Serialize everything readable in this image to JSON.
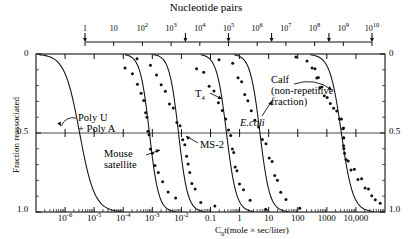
{
  "chart_data": {
    "type": "line",
    "title": "Nucleotide pairs",
    "xlabel": "C0t(mole × sec/liter)",
    "ylabel": "Fraction reassociated",
    "xlim_log10": [
      -7,
      5
    ],
    "ylim": [
      0,
      1
    ],
    "yaxis_inverted": true,
    "grid": false,
    "legend_position": "inline-annotations",
    "y_ticks": [
      {
        "value": 0,
        "label": "0"
      },
      {
        "value": 0.5,
        "label": "0.5"
      },
      {
        "value": 1.0,
        "label": "1.0"
      }
    ],
    "y_ticks_right": [
      {
        "value": 0,
        "label": "0"
      },
      {
        "value": 0.5,
        "label": "0.5"
      },
      {
        "value": 1.0,
        "label": "1.0"
      }
    ],
    "x_ticks": [
      {
        "log10": -6,
        "label": "10⁻⁶",
        "base": "10",
        "exp": "-6"
      },
      {
        "log10": -5,
        "label": "10⁻⁵",
        "base": "10",
        "exp": "-5"
      },
      {
        "log10": -4,
        "label": "10⁻⁴",
        "base": "10",
        "exp": "-4"
      },
      {
        "log10": -3,
        "label": "10⁻³",
        "base": "10",
        "exp": "-3"
      },
      {
        "log10": -2,
        "label": "10⁻²",
        "base": "10",
        "exp": "-2"
      },
      {
        "log10": -1,
        "label": "0.1",
        "base": "0.1",
        "exp": ""
      },
      {
        "log10": 0,
        "label": "1",
        "base": "1",
        "exp": ""
      },
      {
        "log10": 1,
        "label": "10",
        "base": "10",
        "exp": ""
      },
      {
        "log10": 2,
        "label": "100",
        "base": "100",
        "exp": ""
      },
      {
        "log10": 3,
        "label": "1000",
        "base": "1000",
        "exp": ""
      },
      {
        "log10": 4,
        "label": "10,000",
        "base": "10,000",
        "exp": ""
      }
    ],
    "top_axis": {
      "title": "Nucleotide pairs",
      "range_log10": [
        0,
        10
      ],
      "ticks": [
        {
          "log10": 0,
          "base": "1",
          "exp": ""
        },
        {
          "log10": 1,
          "base": "10",
          "exp": ""
        },
        {
          "log10": 2,
          "base": "10",
          "exp": "2"
        },
        {
          "log10": 3,
          "base": "10",
          "exp": "3"
        },
        {
          "log10": 4,
          "base": "10",
          "exp": "4"
        },
        {
          "log10": 5,
          "base": "10",
          "exp": "5"
        },
        {
          "log10": 6,
          "base": "10",
          "exp": "6"
        },
        {
          "log10": 7,
          "base": "10",
          "exp": "7"
        },
        {
          "log10": 8,
          "base": "10",
          "exp": "8"
        },
        {
          "log10": 9,
          "base": "10",
          "exp": "9"
        },
        {
          "log10": 10,
          "base": "10",
          "exp": "10"
        }
      ],
      "arrow_markers_log10": [
        0,
        3.5,
        5,
        6.5,
        8.5,
        10
      ]
    },
    "series": [
      {
        "name": "Poly U + Poly A",
        "label": "Poly U",
        "label2": "+ Poly A",
        "midpoint_cot_log10": -5.5,
        "width_decades": 2.6,
        "has_points": false
      },
      {
        "name": "Mouse satellite",
        "label": "Mouse",
        "label2": "satellite",
        "midpoint_cot_log10": -3.1,
        "width_decades": 1.6,
        "has_points": true
      },
      {
        "name": "MS-2",
        "label": "MS-2",
        "label2": "",
        "midpoint_cot_log10": -2.1,
        "width_decades": 1.6,
        "has_points": true
      },
      {
        "name": "T4",
        "label": "T",
        "label2": "4",
        "midpoint_cot_log10": -0.45,
        "width_decades": 1.7,
        "has_points": true
      },
      {
        "name": "E.coli",
        "label": "E.coli",
        "label2": "",
        "midpoint_cot_log10": 0.7,
        "width_decades": 1.7,
        "has_points": true
      },
      {
        "name": "Calf (non-repetitive fraction)",
        "label": "Calf",
        "label2": "(non-repetitive",
        "label3": "fraction)",
        "midpoint_cot_log10": 3.5,
        "width_decades": 2.0,
        "has_points": true
      }
    ]
  },
  "annotations": {
    "poly_ua_line1": "Poly U",
    "poly_ua_line2": "+ Poly A",
    "mouse_line1": "Mouse",
    "mouse_line2": "satellite",
    "ms2": "MS-2",
    "t4_base": "T",
    "t4_sub": "4",
    "ecoli": "E.coli",
    "calf_line1": "Calf",
    "calf_line2": "(non-repetitive",
    "calf_line3": "fraction)"
  },
  "axes": {
    "y_label": "Fraction reassociated",
    "y_top": "0",
    "y_mid": "0.5",
    "y_bot": "1.0",
    "y_top_right": "0",
    "y_mid_right": "0.5",
    "y_bot_right": "1.0",
    "x_title_prefix": "C",
    "x_title_sub": "0",
    "x_title_rest": "t(mole × sec/liter)"
  },
  "colors": {
    "ink": "#111111",
    "background": "#ffffff"
  }
}
